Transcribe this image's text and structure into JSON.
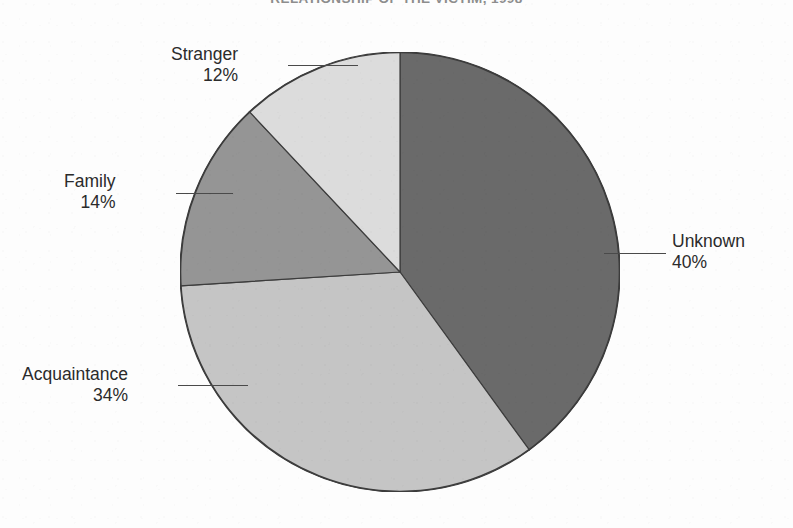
{
  "page": {
    "width": 793,
    "height": 528,
    "background": "#fdfdfd"
  },
  "chart_data": {
    "type": "pie",
    "title": "RELATIONSHIP OF THE VICTIM, 1998",
    "title_clipped": true,
    "subtitle": "",
    "xlabel": "",
    "ylabel": "",
    "unit": "%",
    "start_angle_deg": 0,
    "direction": "clockwise",
    "legend": "none",
    "grid": false,
    "labels_inline": true,
    "categories": [
      "Unknown",
      "Acquaintance",
      "Family",
      "Stranger"
    ],
    "values": [
      40,
      34,
      14,
      12
    ],
    "slices": [
      {
        "label": "Unknown",
        "value": 40,
        "value_text": "40%",
        "color": "#6a6a6a",
        "start_deg": 0,
        "end_deg": 144,
        "callout_side": "right"
      },
      {
        "label": "Acquaintance",
        "value": 34,
        "value_text": "34%",
        "color": "#c5c5c5",
        "start_deg": 144,
        "end_deg": 266.4,
        "callout_side": "left"
      },
      {
        "label": "Family",
        "value": 14,
        "value_text": "14%",
        "color": "#959595",
        "start_deg": 266.4,
        "end_deg": 316.8,
        "callout_side": "left"
      },
      {
        "label": "Stranger",
        "value": 12,
        "value_text": "12%",
        "color": "#dcdcdc",
        "start_deg": 316.8,
        "end_deg": 360,
        "callout_side": "left"
      }
    ],
    "total": 100,
    "stroke_color": "#3c3c3c"
  },
  "geometry": {
    "center_x": 400,
    "center_y": 272,
    "radius": 220
  },
  "colors": {
    "unknown": "#6a6a6a",
    "acquaintance": "#c5c5c5",
    "family": "#959595",
    "stranger": "#dcdcdc",
    "outline": "#3c3c3c",
    "leader_line": "#4a4a4a",
    "label_text": "#2b2b2b",
    "title_text": "#8d8d8d"
  }
}
